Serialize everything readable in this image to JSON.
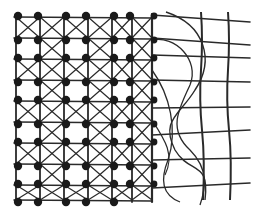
{
  "diagram": {
    "type": "lattice-mesh-illustration",
    "colors": {
      "background": "#ffffff",
      "line": "#2a2a2a",
      "node": "#1a1a1a"
    },
    "dense_region": {
      "x_start": 16,
      "x_end": 152,
      "column_x": [
        16,
        40,
        64,
        88,
        112,
        132,
        152
      ],
      "row_y": [
        17,
        38,
        59,
        80,
        101,
        122,
        143,
        164,
        185,
        200
      ],
      "has_cross_braces": true,
      "has_nodes": true
    },
    "open_region": {
      "x_start": 152,
      "x_end": 250,
      "horizontal_lines_right_y": [
        22,
        45,
        58,
        82,
        107,
        130,
        158,
        183
      ],
      "vertical_wavy_x": [
        201,
        228
      ],
      "has_curved_strands": true
    }
  }
}
